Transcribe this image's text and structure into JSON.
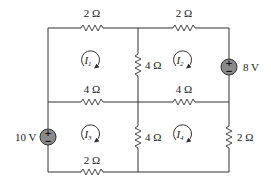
{
  "diagram": {
    "type": "circuit-schematic"
  },
  "resistors": [
    {
      "id": "R_top_left",
      "label": "2 Ω",
      "orientation": "horizontal"
    },
    {
      "id": "R_top_right",
      "label": "2 Ω",
      "orientation": "horizontal"
    },
    {
      "id": "R_mid_vertical_top",
      "label": "4 Ω",
      "orientation": "vertical"
    },
    {
      "id": "R_mid_left",
      "label": "4 Ω",
      "orientation": "horizontal"
    },
    {
      "id": "R_mid_right",
      "label": "4 Ω",
      "orientation": "horizontal"
    },
    {
      "id": "R_mid_vertical_bottom",
      "label": "4 Ω",
      "orientation": "vertical"
    },
    {
      "id": "R_right_bottom",
      "label": "2 Ω",
      "orientation": "vertical"
    },
    {
      "id": "R_bottom_left",
      "label": "2 Ω",
      "orientation": "horizontal"
    }
  ],
  "sources": [
    {
      "id": "V1",
      "label": "8 V",
      "plus": "+",
      "minus": "−"
    },
    {
      "id": "V2",
      "label": "10 V",
      "plus": "+",
      "minus": "−"
    }
  ],
  "mesh_currents": [
    {
      "id": "I1",
      "symbol": "I",
      "subscript": "1",
      "direction": "clockwise"
    },
    {
      "id": "I2",
      "symbol": "I",
      "subscript": "2",
      "direction": "clockwise"
    },
    {
      "id": "I3",
      "symbol": "I",
      "subscript": "3",
      "direction": "clockwise"
    },
    {
      "id": "I4",
      "symbol": "I",
      "subscript": "4",
      "direction": "clockwise"
    }
  ]
}
